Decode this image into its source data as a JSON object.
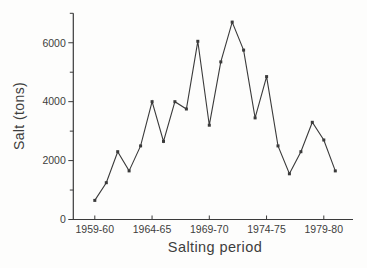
{
  "figure": {
    "background": "#fdfdfc"
  },
  "chart_data": {
    "type": "line",
    "title": "",
    "xlabel": "Salting period",
    "ylabel": "Salt (tons)",
    "categories": [
      "1959-60",
      "1960-61",
      "1961-62",
      "1962-63",
      "1963-64",
      "1964-65",
      "1965-66",
      "1966-67",
      "1967-68",
      "1968-69",
      "1969-70",
      "1970-71",
      "1971-72",
      "1972-73",
      "1973-74",
      "1974-75",
      "1975-76",
      "1976-77",
      "1977-78",
      "1978-79",
      "1979-80",
      "1980-81"
    ],
    "values": [
      650,
      1250,
      2300,
      1650,
      2500,
      4000,
      2650,
      4000,
      3750,
      6050,
      3200,
      5350,
      6700,
      5750,
      3450,
      4850,
      2500,
      1550,
      2300,
      3300,
      2700,
      1650
    ],
    "x_ticks": [
      {
        "index": 0,
        "label": "1959-60"
      },
      {
        "index": 5,
        "label": "1964-65"
      },
      {
        "index": 10,
        "label": "1969-70"
      },
      {
        "index": 15,
        "label": "1974-75"
      },
      {
        "index": 20,
        "label": "1979-80"
      }
    ],
    "y_ticks": [
      {
        "value": 0,
        "label": "0"
      },
      {
        "value": 2000,
        "label": "2000"
      },
      {
        "value": 4000,
        "label": "4000"
      },
      {
        "value": 6000,
        "label": "6000"
      }
    ],
    "y_minor_tick_step": 1000,
    "ylim": [
      0,
      7000
    ],
    "grid": false,
    "legend": null,
    "marker": "square-dot",
    "line_color": "#3a3a3a",
    "text_color": "#3d3d3d"
  }
}
